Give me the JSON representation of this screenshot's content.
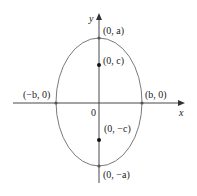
{
  "diagram": {
    "type": "ellipse-vertical-major-axis",
    "colors": {
      "axis": "#333333",
      "ellipse": "#7a7a7a",
      "point": "#111111",
      "text": "#222222"
    },
    "axes": {
      "x_label": "x",
      "y_label": "y",
      "origin_label": "0"
    },
    "points": [
      {
        "id": "top-vertex",
        "label": "(0, a)"
      },
      {
        "id": "upper-focus",
        "label": "(0, c)"
      },
      {
        "id": "left-vertex",
        "label": "(−b, 0)"
      },
      {
        "id": "right-vertex",
        "label": "(b, 0)"
      },
      {
        "id": "lower-focus",
        "label": "(0, −c)"
      },
      {
        "id": "bottom-vertex",
        "label": "(0, −a)"
      }
    ]
  }
}
